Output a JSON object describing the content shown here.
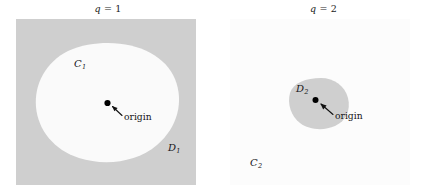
{
  "figure": {
    "width": 431,
    "height": 196,
    "background": "#ffffff",
    "panels": [
      {
        "id": "left",
        "title_var": "q",
        "title_op": " = ",
        "title_value": "1",
        "outer_region_fill": "#cfcfcf",
        "inner_region_fill": "#fafafa",
        "outer_label": "D",
        "outer_label_sub": "1",
        "inner_label": "C",
        "inner_label_sub": "1",
        "origin_label": "origin",
        "origin_dot_color": "#000000"
      },
      {
        "id": "right",
        "title_var": "q",
        "title_op": " = ",
        "title_value": "2",
        "outer_region_fill": "#fcfcfc",
        "inner_region_fill": "#cfcfcf",
        "outer_label": "C",
        "outer_label_sub": "2",
        "inner_label": "D",
        "inner_label_sub": "2",
        "origin_label": "origin",
        "origin_dot_color": "#000000"
      }
    ]
  },
  "left_panel": {
    "title_var": "q",
    "title_op": " = ",
    "title_value": "1",
    "label_C1": "C",
    "label_C1_sub": "1",
    "label_D1": "D",
    "label_D1_sub": "1",
    "origin_text": "origin"
  },
  "right_panel": {
    "title_var": "q",
    "title_op": " = ",
    "title_value": "2",
    "label_C2": "C",
    "label_C2_sub": "2",
    "label_D2": "D",
    "label_D2_sub": "2",
    "origin_text": "origin"
  },
  "colors": {
    "gray_region": "#cfcfcf",
    "white_region": "#fafafa",
    "near_white_region": "#fcfcfc",
    "text": "#17171a",
    "dot": "#000000"
  }
}
